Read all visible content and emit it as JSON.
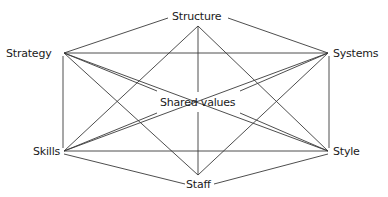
{
  "diagram": {
    "type": "network",
    "title": "",
    "nodes": [
      {
        "id": "structure",
        "label": "Structure"
      },
      {
        "id": "strategy",
        "label": "Strategy"
      },
      {
        "id": "systems",
        "label": "Systems"
      },
      {
        "id": "shared_values",
        "label": "Shared values"
      },
      {
        "id": "skills",
        "label": "Skills"
      },
      {
        "id": "style",
        "label": "Style"
      },
      {
        "id": "staff",
        "label": "Staff"
      }
    ],
    "edges": [
      [
        "structure",
        "strategy"
      ],
      [
        "structure",
        "systems"
      ],
      [
        "structure",
        "shared_values"
      ],
      [
        "structure",
        "skills"
      ],
      [
        "structure",
        "style"
      ],
      [
        "strategy",
        "systems"
      ],
      [
        "strategy",
        "skills"
      ],
      [
        "strategy",
        "shared_values"
      ],
      [
        "strategy",
        "staff"
      ],
      [
        "strategy",
        "style"
      ],
      [
        "systems",
        "shared_values"
      ],
      [
        "systems",
        "skills"
      ],
      [
        "systems",
        "style"
      ],
      [
        "systems",
        "staff"
      ],
      [
        "skills",
        "shared_values"
      ],
      [
        "skills",
        "style"
      ],
      [
        "skills",
        "staff"
      ],
      [
        "style",
        "shared_values"
      ],
      [
        "style",
        "staff"
      ],
      [
        "staff",
        "shared_values"
      ]
    ],
    "line_color": "#3a3a3a"
  }
}
